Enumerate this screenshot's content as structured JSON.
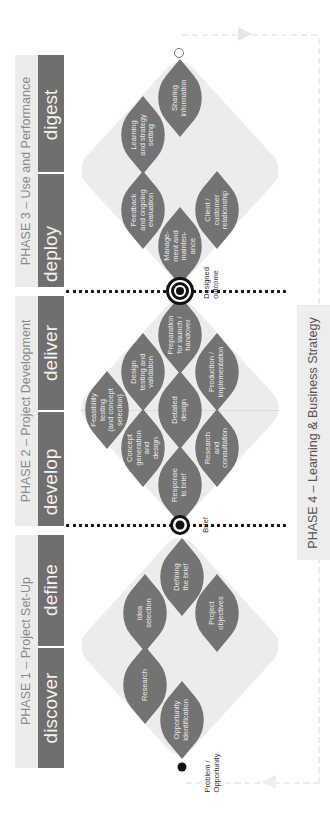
{
  "diagram": {
    "orientation": "rotated -90deg (reads bottom-to-top)",
    "colors": {
      "stage_bar": "#6f6f6f",
      "leaf": "#737373",
      "diamond_bg": "#ececec",
      "title_text": "#8a8a8a",
      "marker": "#111111"
    }
  },
  "phases": [
    {
      "title": "PHASE 1 – Project Set-Up",
      "stages": [
        "discover",
        "define"
      ],
      "activities": [
        "Opportunity identification",
        "Research",
        "Idea selection",
        "Project objectives",
        "Defining the brief"
      ]
    },
    {
      "title": "PHASE 2 – Project Development",
      "stages": [
        "develop",
        "deliver"
      ],
      "activities": [
        "Response to brief",
        "Concept generation and design",
        "Research and consultation",
        "Feasibility testing (and concept selection)",
        "Detailed design",
        "Design testing and validation",
        "Production / implementation",
        "Preparation for launch / handover"
      ]
    },
    {
      "title": "PHASE 3 – Use and Performance",
      "stages": [
        "deploy",
        "digest"
      ],
      "activities": [
        "Manage-ment and mainten-ance",
        "Feedback and ongoing evaluation",
        "Client / customer relationship",
        "Learning and strategy setting",
        "Sharing information"
      ]
    },
    {
      "title": "PHASE 4 – Learning & Business Strategy"
    }
  ],
  "labels": {
    "p1_title": "PHASE 1 – Project Set-Up",
    "p2_title": "PHASE 2 – Project Development",
    "p3_title": "PHASE 3 – Use and Performance",
    "p4_title": "PHASE 4 – Learning & Business Strategy",
    "discover": "discover",
    "define": "define",
    "develop": "develop",
    "deliver": "deliver",
    "deploy": "deploy",
    "digest": "digest",
    "opportunity": "Opportunity\nidentification",
    "research": "Research",
    "idea": "Idea\nselection",
    "objectives": "Project\nobjectives",
    "defining": "Defining\nthe brief",
    "response": "Response\nto brief",
    "concept": "Concept\ngeneration\nand\ndesign",
    "consult": "Research\nand\nconsultation",
    "feasibility": "Feasibility\ntesting\n(and concept\nselection)",
    "detailed": "Detailed\ndesign",
    "testing": "Design\ntesting and\nvalidation",
    "production": "Production /\nimplementation",
    "preparation": "Preparation\nfor launch /\nhandover",
    "management": "Manage-\nment and\nmainten-\nance",
    "feedback": "Feedback\nand ongoing\nevaluation",
    "client": "Client /\ncustomer\nrelationship",
    "learning": "Learning\nand strategy\nsetting",
    "sharing": "Sharing\ninformation",
    "problem": "Problem /\nOpportunity",
    "brief": "Brief",
    "designed_outcome": "Designed\noutcome"
  }
}
